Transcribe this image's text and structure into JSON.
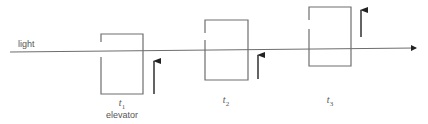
{
  "diagram": {
    "beam_label": "light",
    "colors": {
      "stroke": "#6e6e6e",
      "arrow": "#222222",
      "text": "#555555",
      "background": "#ffffff"
    },
    "beam": {
      "x1": 10,
      "y1": 52,
      "x2": 416,
      "y2": 48
    },
    "frames": [
      {
        "id": "t1",
        "time_label": "t",
        "time_sub": "1",
        "caption": "elevator",
        "box": {
          "x": 101,
          "y": 34,
          "w": 42,
          "h": 60,
          "gap_top": 42,
          "gap_bottom": 57
        },
        "arrow": {
          "x": 154,
          "y_tail": 94,
          "y_head": 59
        },
        "label_pos": {
          "x": 122,
          "y": 106
        }
      },
      {
        "id": "t2",
        "time_label": "t",
        "time_sub": "2",
        "caption": "",
        "box": {
          "x": 205,
          "y": 20,
          "w": 43,
          "h": 60,
          "gap_top": 33,
          "gap_bottom": 40
        },
        "arrow": {
          "x": 258,
          "y_tail": 79,
          "y_head": 53
        },
        "label_pos": {
          "x": 226,
          "y": 103
        }
      },
      {
        "id": "t3",
        "time_label": "t",
        "time_sub": "3",
        "caption": "",
        "box": {
          "x": 309,
          "y": 7,
          "w": 42,
          "h": 59,
          "gap_top": 20,
          "gap_bottom": 29
        },
        "arrow": {
          "x": 361,
          "y_tail": 37,
          "y_head": 8
        },
        "label_pos": {
          "x": 330,
          "y": 103
        }
      }
    ]
  }
}
